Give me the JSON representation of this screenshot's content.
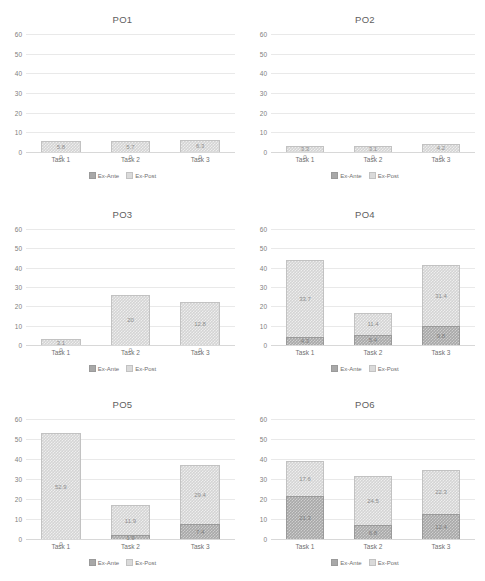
{
  "figure": {
    "categories": [
      "Task 1",
      "Task 2",
      "Task 3"
    ],
    "y_ticks": [
      "60",
      "50",
      "40",
      "30",
      "20",
      "10",
      "0"
    ],
    "ylim": [
      0,
      60
    ],
    "legend": {
      "ante_label": "Ex-Ante",
      "post_label": "Ex-Post"
    },
    "colors": {
      "ex_ante": "#a8a8a8",
      "ex_post": "#d4d4d4",
      "gridline": "#e9e9e9",
      "text": "#6f6f6f",
      "background": "#ffffff"
    }
  },
  "chart_data": [
    {
      "type": "bar",
      "title": "PO1",
      "stacked": true,
      "categories": [
        "Task 1",
        "Task 2",
        "Task 3"
      ],
      "xlabel": "",
      "ylabel": "",
      "ylim": [
        0,
        60
      ],
      "grid": true,
      "legend_position": "bottom",
      "series": [
        {
          "name": "Ex-Ante",
          "values": [
            0,
            0,
            0
          ],
          "labels": [
            "0",
            "0",
            "0"
          ]
        },
        {
          "name": "Ex-Post",
          "values": [
            5.8,
            5.7,
            6.3
          ],
          "labels": [
            "5.8",
            "5.7",
            "6.3"
          ]
        }
      ]
    },
    {
      "type": "bar",
      "title": "PO2",
      "stacked": true,
      "categories": [
        "Task 1",
        "Task 2",
        "Task 3"
      ],
      "xlabel": "",
      "ylabel": "",
      "ylim": [
        0,
        60
      ],
      "grid": true,
      "legend_position": "bottom",
      "series": [
        {
          "name": "Ex-Ante",
          "values": [
            0,
            0,
            0
          ],
          "labels": [
            "0",
            "0",
            "0"
          ]
        },
        {
          "name": "Ex-Post",
          "values": [
            3.3,
            3.1,
            4.2
          ],
          "labels": [
            "3.3",
            "3.1",
            "4.2"
          ]
        }
      ]
    },
    {
      "type": "bar",
      "title": "PO3",
      "stacked": true,
      "categories": [
        "Task 1",
        "Task 2",
        "Task 3"
      ],
      "xlabel": "",
      "ylabel": "",
      "ylim": [
        0,
        60
      ],
      "grid": true,
      "legend_position": "bottom",
      "series": [
        {
          "name": "Ex-Ante",
          "values": [
            0,
            0,
            0
          ],
          "labels": [
            "0",
            "0",
            "0"
          ]
        },
        {
          "name": "Ex-Post",
          "values": [
            3.1,
            26.0,
            22.0
          ],
          "labels": [
            "3.1",
            "20",
            "12.8"
          ]
        }
      ]
    },
    {
      "type": "bar",
      "title": "PO4",
      "stacked": true,
      "categories": [
        "Task 1",
        "Task 2",
        "Task 3"
      ],
      "xlabel": "",
      "ylabel": "",
      "ylim": [
        0,
        60
      ],
      "grid": true,
      "legend_position": "bottom",
      "series": [
        {
          "name": "Ex-Ante",
          "values": [
            4.3,
            5.4,
            9.8
          ],
          "labels": [
            "4.3",
            "5.4",
            "9.8"
          ]
        },
        {
          "name": "Ex-Post",
          "values": [
            39.7,
            11.4,
            31.4
          ],
          "labels": [
            "33.7",
            "11.4",
            "31.4"
          ]
        }
      ]
    },
    {
      "type": "bar",
      "title": "PO5",
      "stacked": true,
      "categories": [
        "Task 1",
        "Task 2",
        "Task 3"
      ],
      "xlabel": "",
      "ylabel": "",
      "ylim": [
        0,
        60
      ],
      "grid": true,
      "legend_position": "bottom",
      "series": [
        {
          "name": "Ex-Ante",
          "values": [
            0,
            1.9,
            7.4
          ],
          "labels": [
            "0",
            "1.9",
            "7.4"
          ]
        },
        {
          "name": "Ex-Post",
          "values": [
            52.9,
            15.1,
            29.4
          ],
          "labels": [
            "52.9",
            "11.9",
            "29.4"
          ]
        }
      ]
    },
    {
      "type": "bar",
      "title": "PO6",
      "stacked": true,
      "categories": [
        "Task 1",
        "Task 2",
        "Task 3"
      ],
      "xlabel": "",
      "ylabel": "",
      "ylim": [
        0,
        60
      ],
      "grid": true,
      "legend_position": "bottom",
      "series": [
        {
          "name": "Ex-Ante",
          "values": [
            21.3,
            6.8,
            12.4
          ],
          "labels": [
            "21.3",
            "6.8",
            "12.4"
          ]
        },
        {
          "name": "Ex-Post",
          "values": [
            17.6,
            24.5,
            22.3
          ],
          "labels": [
            "17.6",
            "24.5",
            "22.3"
          ]
        }
      ]
    }
  ]
}
